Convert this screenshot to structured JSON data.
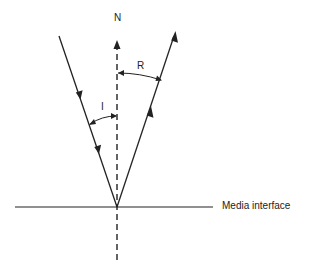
{
  "diagram": {
    "type": "reflection-of-light",
    "labels": {
      "normal": "N",
      "angle_incidence": "I",
      "angle_reflection": "R",
      "interface": "Media interface"
    },
    "colors": {
      "line": "#222222",
      "background": "#ffffff"
    },
    "elements": {
      "normal_line": {
        "style": "dashed",
        "from": [
          117,
          260
        ],
        "to": [
          117,
          42
        ],
        "arrow": "up"
      },
      "interface_line": {
        "style": "solid",
        "from": [
          15,
          207
        ],
        "to": [
          213,
          207
        ]
      },
      "incident_ray": {
        "style": "solid",
        "from": [
          59,
          36
        ],
        "to": [
          117,
          207
        ],
        "arrows": [
          "down",
          "down"
        ]
      },
      "reflected_ray": {
        "style": "solid",
        "from": [
          117,
          207
        ],
        "to": [
          175,
          32
        ],
        "arrows": [
          "up",
          "up"
        ]
      }
    }
  }
}
